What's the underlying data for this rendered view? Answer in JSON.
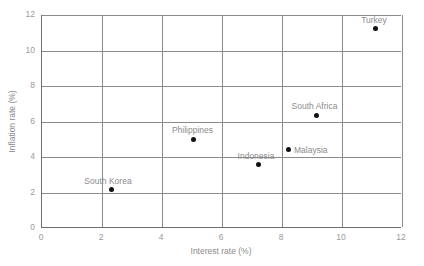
{
  "chart_data": {
    "type": "scatter",
    "title": "",
    "xlabel": "Interest rate (%)",
    "ylabel": "Inflation rate (%)",
    "xlim": [
      0,
      12
    ],
    "ylim": [
      0,
      12
    ],
    "xticks": [
      0,
      2,
      4,
      6,
      8,
      10,
      12
    ],
    "yticks": [
      0,
      2,
      4,
      6,
      8,
      10,
      12
    ],
    "grid": true,
    "legend": "none",
    "point_color": "#111111",
    "label_color": "#8c8c8c",
    "grid_color": "#8a8a8a",
    "points": [
      {
        "name": "South Korea",
        "x": 2.3,
        "y": 2.15,
        "label_dx": -3,
        "label_dy": -14
      },
      {
        "name": "Philippines",
        "x": 5.05,
        "y": 5.0,
        "label_dx": -1,
        "label_dy": -14
      },
      {
        "name": "Indonesia",
        "x": 7.2,
        "y": 3.55,
        "label_dx": -2,
        "label_dy": -14
      },
      {
        "name": "Malaysia",
        "x": 8.2,
        "y": 4.4,
        "label_dx": 6,
        "label_dy": -5
      },
      {
        "name": "South Africa",
        "x": 9.15,
        "y": 6.35,
        "label_dx": -2,
        "label_dy": -14
      },
      {
        "name": "Turkey",
        "x": 11.1,
        "y": 11.25,
        "label_dx": -1,
        "label_dy": -13
      }
    ]
  }
}
